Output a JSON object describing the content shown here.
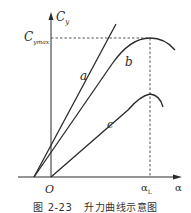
{
  "diagram": {
    "axes": {
      "y_label": "C",
      "y_label_sub": "y",
      "x_label": "α",
      "origin_label": "O",
      "ymax_label": "C",
      "ymax_label_sub": "ymax",
      "x_mark_label": "α",
      "x_mark_label_sub": "L"
    },
    "curves": [
      {
        "name": "a",
        "label": "a",
        "description": "straight line"
      },
      {
        "name": "b",
        "label": "b",
        "description": "lift curve reaching Cymax at αL"
      },
      {
        "name": "c",
        "label": "c",
        "description": "lower lift curve"
      }
    ],
    "colors": {
      "line": "#2a2a2a",
      "dashed": "#444444",
      "background": "#ffffff"
    }
  },
  "caption": {
    "figure_number": "图 2-23",
    "title": "升力曲线示意图"
  }
}
